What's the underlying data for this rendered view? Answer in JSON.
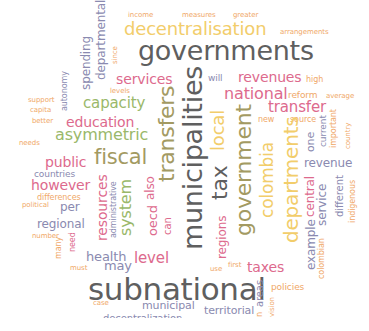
{
  "colors": {
    "darkgray": "#5f5f5f",
    "yellow": "#f2cd6b",
    "pink": "#dd6a8d",
    "green": "#9ab86a",
    "olive": "#a39a62",
    "lavender": "#8a8ab0",
    "orange": "#f0a868",
    "background": "#ffffff"
  },
  "words": [
    {
      "text": "income",
      "x": 128,
      "y": 12,
      "size": 7,
      "color": "orange",
      "rot": 0
    },
    {
      "text": "measures",
      "x": 182,
      "y": 12,
      "size": 7,
      "color": "orange",
      "rot": 0
    },
    {
      "text": "greater",
      "x": 233,
      "y": 12,
      "size": 7,
      "color": "orange",
      "rot": 0
    },
    {
      "text": "decentralisation",
      "x": 124,
      "y": 20,
      "size": 18,
      "color": "yellow",
      "rot": 0
    },
    {
      "text": "arrangements",
      "x": 280,
      "y": 29,
      "size": 7,
      "color": "orange",
      "rot": 0
    },
    {
      "text": "governments",
      "x": 138,
      "y": 37,
      "size": 27,
      "color": "darkgray",
      "rot": 0
    },
    {
      "text": "services",
      "x": 116,
      "y": 72,
      "size": 14,
      "color": "pink",
      "rot": 0
    },
    {
      "text": "will",
      "x": 208,
      "y": 74,
      "size": 9,
      "color": "lavender",
      "rot": 0
    },
    {
      "text": "revenues",
      "x": 238,
      "y": 70,
      "size": 14,
      "color": "pink",
      "rot": 0
    },
    {
      "text": "high",
      "x": 306,
      "y": 76,
      "size": 8,
      "color": "orange",
      "rot": 0
    },
    {
      "text": "levels",
      "x": 110,
      "y": 88,
      "size": 7,
      "color": "orange",
      "rot": 0
    },
    {
      "text": "national",
      "x": 224,
      "y": 86,
      "size": 16,
      "color": "pink",
      "rot": 0
    },
    {
      "text": "reform",
      "x": 288,
      "y": 91,
      "size": 9,
      "color": "orange",
      "rot": 0
    },
    {
      "text": "average",
      "x": 326,
      "y": 93,
      "size": 7,
      "color": "orange",
      "rot": 0
    },
    {
      "text": "support",
      "x": 28,
      "y": 97,
      "size": 7,
      "color": "orange",
      "rot": 0
    },
    {
      "text": "capacity",
      "x": 83,
      "y": 96,
      "size": 15,
      "color": "green",
      "rot": 0
    },
    {
      "text": "transfer",
      "x": 268,
      "y": 100,
      "size": 15,
      "color": "pink",
      "rot": 0
    },
    {
      "text": "capita",
      "x": 30,
      "y": 107,
      "size": 7,
      "color": "orange",
      "rot": 0
    },
    {
      "text": "new",
      "x": 258,
      "y": 116,
      "size": 8,
      "color": "orange",
      "rot": 0
    },
    {
      "text": "source",
      "x": 290,
      "y": 116,
      "size": 8,
      "color": "orange",
      "rot": 0
    },
    {
      "text": "better",
      "x": 32,
      "y": 118,
      "size": 7,
      "color": "orange",
      "rot": 0
    },
    {
      "text": "education",
      "x": 66,
      "y": 115,
      "size": 14,
      "color": "pink",
      "rot": 0
    },
    {
      "text": "asymmetric",
      "x": 55,
      "y": 127,
      "size": 16,
      "color": "green",
      "rot": 0
    },
    {
      "text": "needs",
      "x": 19,
      "y": 140,
      "size": 7,
      "color": "orange",
      "rot": 0
    },
    {
      "text": "fiscal",
      "x": 94,
      "y": 147,
      "size": 21,
      "color": "olive",
      "rot": 0
    },
    {
      "text": "public",
      "x": 45,
      "y": 155,
      "size": 14,
      "color": "pink",
      "rot": 0
    },
    {
      "text": "revenue",
      "x": 304,
      "y": 157,
      "size": 12,
      "color": "lavender",
      "rot": 0
    },
    {
      "text": "countries",
      "x": 34,
      "y": 170,
      "size": 9,
      "color": "lavender",
      "rot": 0
    },
    {
      "text": "however",
      "x": 31,
      "y": 178,
      "size": 14,
      "color": "pink",
      "rot": 0
    },
    {
      "text": "differences",
      "x": 37,
      "y": 194,
      "size": 8,
      "color": "orange",
      "rot": 0
    },
    {
      "text": "political",
      "x": 22,
      "y": 202,
      "size": 7,
      "color": "orange",
      "rot": 0
    },
    {
      "text": "per",
      "x": 60,
      "y": 201,
      "size": 12,
      "color": "lavender",
      "rot": 0
    },
    {
      "text": "regional",
      "x": 37,
      "y": 218,
      "size": 12,
      "color": "lavender",
      "rot": 0
    },
    {
      "text": "number",
      "x": 32,
      "y": 233,
      "size": 7,
      "color": "orange",
      "rot": 0
    },
    {
      "text": "health",
      "x": 86,
      "y": 250,
      "size": 13,
      "color": "lavender",
      "rot": 0
    },
    {
      "text": "level",
      "x": 134,
      "y": 251,
      "size": 15,
      "color": "pink",
      "rot": 0
    },
    {
      "text": "may",
      "x": 104,
      "y": 259,
      "size": 13,
      "color": "lavender",
      "rot": 0
    },
    {
      "text": "must",
      "x": 70,
      "y": 265,
      "size": 7,
      "color": "orange",
      "rot": 0
    },
    {
      "text": "use",
      "x": 210,
      "y": 266,
      "size": 7,
      "color": "orange",
      "rot": 0
    },
    {
      "text": "first",
      "x": 228,
      "y": 262,
      "size": 7,
      "color": "orange",
      "rot": 0
    },
    {
      "text": "taxes",
      "x": 247,
      "y": 260,
      "size": 14,
      "color": "pink",
      "rot": 0
    },
    {
      "text": "subnational",
      "x": 88,
      "y": 274,
      "size": 31,
      "color": "darkgray",
      "rot": 0
    },
    {
      "text": "policies",
      "x": 271,
      "y": 283,
      "size": 9,
      "color": "orange",
      "rot": 0
    },
    {
      "text": "case",
      "x": 93,
      "y": 300,
      "size": 7,
      "color": "orange",
      "rot": 0
    },
    {
      "text": "municipal",
      "x": 142,
      "y": 300,
      "size": 11,
      "color": "lavender",
      "rot": 0
    },
    {
      "text": "territorial",
      "x": 204,
      "y": 305,
      "size": 11,
      "color": "lavender",
      "rot": 0
    },
    {
      "text": "decentralization",
      "x": 103,
      "y": 314,
      "size": 10,
      "color": "lavender",
      "rot": 0
    },
    {
      "text": "spending",
      "x": 80,
      "y": 90,
      "size": 12,
      "color": "lavender",
      "rot": -90
    },
    {
      "text": "departmental",
      "x": 95,
      "y": 80,
      "size": 12,
      "color": "lavender",
      "rot": -90
    },
    {
      "text": "since",
      "x": 112,
      "y": 64,
      "size": 7,
      "color": "orange",
      "rot": -90
    },
    {
      "text": "autonomy",
      "x": 61,
      "y": 111,
      "size": 8,
      "color": "lavender",
      "rot": -90
    },
    {
      "text": "transfers",
      "x": 156,
      "y": 182,
      "size": 22,
      "color": "olive",
      "rot": -90
    },
    {
      "text": "municipalities",
      "x": 179,
      "y": 250,
      "size": 27,
      "color": "darkgray",
      "rot": -90
    },
    {
      "text": "tax",
      "x": 209,
      "y": 200,
      "size": 22,
      "color": "darkgray",
      "rot": -90
    },
    {
      "text": "local",
      "x": 209,
      "y": 151,
      "size": 18,
      "color": "yellow",
      "rot": -90
    },
    {
      "text": "government",
      "x": 233,
      "y": 236,
      "size": 22,
      "color": "olive",
      "rot": -90
    },
    {
      "text": "colombia",
      "x": 259,
      "y": 218,
      "size": 17,
      "color": "yellow",
      "rot": -90
    },
    {
      "text": "departments",
      "x": 281,
      "y": 243,
      "size": 20,
      "color": "yellow",
      "rot": -90
    },
    {
      "text": "one",
      "x": 305,
      "y": 152,
      "size": 11,
      "color": "lavender",
      "rot": -90
    },
    {
      "text": "current",
      "x": 319,
      "y": 147,
      "size": 9,
      "color": "lavender",
      "rot": -90
    },
    {
      "text": "important",
      "x": 330,
      "y": 148,
      "size": 8,
      "color": "orange",
      "rot": -90
    },
    {
      "text": "country",
      "x": 345,
      "y": 149,
      "size": 7,
      "color": "orange",
      "rot": -90
    },
    {
      "text": "resources",
      "x": 95,
      "y": 241,
      "size": 14,
      "color": "pink",
      "rot": -90
    },
    {
      "text": "administrative",
      "x": 110,
      "y": 238,
      "size": 8,
      "color": "lavender",
      "rot": -90
    },
    {
      "text": "system",
      "x": 118,
      "y": 236,
      "size": 16,
      "color": "green",
      "rot": -90
    },
    {
      "text": "also",
      "x": 144,
      "y": 200,
      "size": 12,
      "color": "pink",
      "rot": -90
    },
    {
      "text": "oecd",
      "x": 146,
      "y": 236,
      "size": 13,
      "color": "pink",
      "rot": -90
    },
    {
      "text": "can",
      "x": 163,
      "y": 235,
      "size": 10,
      "color": "pink",
      "rot": -90
    },
    {
      "text": "regions",
      "x": 216,
      "y": 259,
      "size": 12,
      "color": "pink",
      "rot": -90
    },
    {
      "text": "central",
      "x": 304,
      "y": 217,
      "size": 12,
      "color": "pink",
      "rot": -90
    },
    {
      "text": "service",
      "x": 316,
      "y": 226,
      "size": 12,
      "color": "lavender",
      "rot": -90
    },
    {
      "text": "different",
      "x": 335,
      "y": 217,
      "size": 10,
      "color": "lavender",
      "rot": -90
    },
    {
      "text": "indigenous",
      "x": 349,
      "y": 223,
      "size": 8,
      "color": "orange",
      "rot": -90
    },
    {
      "text": "example",
      "x": 305,
      "y": 270,
      "size": 12,
      "color": "lavender",
      "rot": -90
    },
    {
      "text": "colombian",
      "x": 318,
      "y": 279,
      "size": 8,
      "color": "orange",
      "rot": -90
    },
    {
      "text": "many",
      "x": 55,
      "y": 259,
      "size": 8,
      "color": "orange",
      "rot": -90
    },
    {
      "text": "need",
      "x": 69,
      "y": 252,
      "size": 8,
      "color": "pink",
      "rot": -90
    },
    {
      "text": "areas",
      "x": 255,
      "y": 307,
      "size": 10,
      "color": "lavender",
      "rot": -90
    },
    {
      "text": "n",
      "x": 256,
      "y": 317,
      "size": 8,
      "color": "orange",
      "rot": -90
    },
    {
      "text": "vision",
      "x": 269,
      "y": 317,
      "size": 7,
      "color": "orange",
      "rot": -90
    }
  ]
}
